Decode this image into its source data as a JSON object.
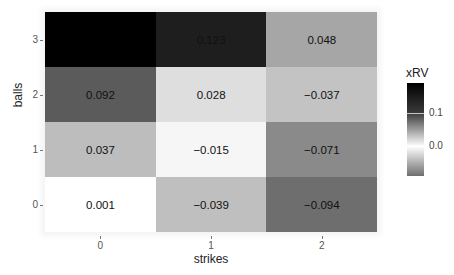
{
  "chart_data": {
    "type": "heatmap",
    "title": "",
    "xlabel": "strikes",
    "ylabel": "balls",
    "x_categories": [
      "0",
      "1",
      "2"
    ],
    "y_categories": [
      "0",
      "1",
      "2",
      "3"
    ],
    "legend": {
      "title": "xRV",
      "ticks": [
        "0.1",
        "0.0"
      ],
      "gradient": [
        "#000000",
        "#3a3a3a",
        "#ffffff",
        "#6e6e6e"
      ],
      "position": "right"
    },
    "cells": [
      {
        "strikes": "0",
        "balls": "3",
        "value": null,
        "label": "",
        "color": "#000000"
      },
      {
        "strikes": "1",
        "balls": "3",
        "value": 0.123,
        "label": "0.123",
        "color": "#1e1e1e"
      },
      {
        "strikes": "2",
        "balls": "3",
        "value": 0.048,
        "label": "0.048",
        "color": "#a6a6a6"
      },
      {
        "strikes": "0",
        "balls": "2",
        "value": 0.092,
        "label": "0.092",
        "color": "#5b5b5b"
      },
      {
        "strikes": "1",
        "balls": "2",
        "value": 0.028,
        "label": "0.028",
        "color": "#dedede"
      },
      {
        "strikes": "2",
        "balls": "2",
        "value": -0.037,
        "label": "−0.037",
        "color": "#c3c3c3"
      },
      {
        "strikes": "0",
        "balls": "1",
        "value": 0.037,
        "label": "0.037",
        "color": "#bdbdbd"
      },
      {
        "strikes": "1",
        "balls": "1",
        "value": -0.015,
        "label": "−0.015",
        "color": "#f6f6f6"
      },
      {
        "strikes": "2",
        "balls": "1",
        "value": -0.071,
        "label": "−0.071",
        "color": "#8a8a8a"
      },
      {
        "strikes": "0",
        "balls": "0",
        "value": 0.001,
        "label": "0.001",
        "color": "#ffffff"
      },
      {
        "strikes": "1",
        "balls": "0",
        "value": -0.039,
        "label": "−0.039",
        "color": "#bfbfbf"
      },
      {
        "strikes": "2",
        "balls": "0",
        "value": -0.094,
        "label": "−0.094",
        "color": "#6e6e6e"
      }
    ],
    "grid": false
  }
}
